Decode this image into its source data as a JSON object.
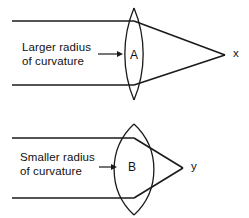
{
  "figure": {
    "background_color": "#ffffff",
    "line_color": "#1a1a1a",
    "width": 249,
    "height": 218
  },
  "panels": [
    {
      "id": "panel-a",
      "lens_letter": "A",
      "caption_line1": "Larger radius",
      "caption_line2": "of curvature",
      "focal_point_label": "x",
      "incoming_ray_top_y": 21,
      "incoming_ray_bottom_y": 85,
      "ray_start_x": 12,
      "lens_center_x": 134,
      "lens_left_x": 121,
      "lens_right_x": 148,
      "lens_top_y": 8,
      "lens_bottom_y": 100,
      "focal_point_x": 225,
      "focal_point_y": 55
    },
    {
      "id": "panel-b",
      "lens_letter": "B",
      "caption_line1": "Smaller radius",
      "caption_line2": "of curvature",
      "focal_point_label": "y",
      "incoming_ray_top_y": 138,
      "incoming_ray_bottom_y": 198,
      "ray_start_x": 12,
      "lens_center_x": 134,
      "lens_left_x": 116,
      "lens_right_x": 152,
      "lens_top_y": 124,
      "lens_bottom_y": 215,
      "focal_point_x": 183,
      "focal_point_y": 168
    }
  ]
}
